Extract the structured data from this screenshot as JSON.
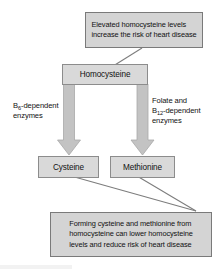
{
  "diagram": {
    "colors": {
      "box_fill": "#d9d9d9",
      "box_border": "#8c8c8c",
      "callout_fill": "#d4d4d4",
      "callout_border": "#7a7a7a",
      "arrow_fill": "#c3c3c3",
      "arrow_border": "#a8a8a8",
      "leader_line": "#8a8a8a",
      "text": "#111111",
      "background": "#ffffff"
    },
    "callouts": [
      {
        "id": "callout-top",
        "lines": [
          "Elevated homocysteine levels",
          "increase the risk of heart disease"
        ]
      },
      {
        "id": "callout-bottom",
        "lines": [
          "Forming cysteine and methionine from",
          "homocysteine can lower homocysteine",
          "levels and reduce risk of heart disease"
        ]
      }
    ],
    "nodes": [
      {
        "id": "homocysteine",
        "label": "Homocysteine"
      },
      {
        "id": "cysteine",
        "label": "Cysteine"
      },
      {
        "id": "methionine",
        "label": "Methionine"
      }
    ],
    "enzyme_labels": [
      {
        "id": "b6-enzymes",
        "line1_prefix": "B",
        "line1_sub": "6",
        "line1_suffix": "-dependent",
        "line2": "enzymes"
      },
      {
        "id": "folate-b12-enzymes",
        "line0": "Folate and",
        "line1_prefix": "B",
        "line1_sub": "12",
        "line1_suffix": "-dependent",
        "line2": "enzymes"
      }
    ],
    "arrows": [
      {
        "id": "arrow-homocysteine-to-cysteine",
        "from": "homocysteine",
        "to": "cysteine"
      },
      {
        "id": "arrow-homocysteine-to-methionine",
        "from": "homocysteine",
        "to": "methionine"
      }
    ],
    "leaders": [
      {
        "id": "leader-top-callout-to-homocysteine",
        "from": "callout-top",
        "to": "homocysteine"
      },
      {
        "id": "leader-cysteine-to-bottom-callout",
        "from": "cysteine",
        "to": "callout-bottom"
      },
      {
        "id": "leader-methionine-to-bottom-callout",
        "from": "methionine",
        "to": "callout-bottom"
      }
    ]
  }
}
